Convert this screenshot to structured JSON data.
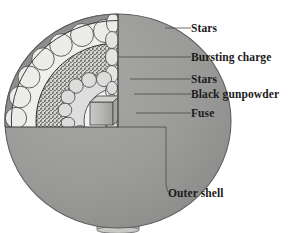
{
  "figure": {
    "background_color": "#ffffff",
    "text_color": "#1b1b1b",
    "leader_color": "#4a4a4a"
  },
  "labels": [
    {
      "key": "stars_outer",
      "text": "Stars",
      "x": 191,
      "y": 32,
      "leader": "M165,28 L191,28",
      "target": "outer-stars-layer"
    },
    {
      "key": "bursting_charge",
      "text": "Bursting charge",
      "x": 191,
      "y": 61,
      "leader": "M117,57 L191,57",
      "target": "bursting-charge-layer"
    },
    {
      "key": "stars_inner",
      "text": "Stars",
      "x": 191,
      "y": 83,
      "leader": "M130,79 L191,79",
      "target": "inner-stars-layer"
    },
    {
      "key": "black_gunpowder",
      "text": "Black gunpowder",
      "x": 191,
      "y": 98,
      "leader": "M134,94 L191,94",
      "target": "black-gunpowder-core"
    },
    {
      "key": "fuse",
      "text": "Fuse",
      "x": 191,
      "y": 117,
      "leader": "M136,113 L191,113",
      "target": "fuse-cylinder"
    },
    {
      "key": "outer_shell",
      "text": "Outer shell",
      "x": 168,
      "y": 197,
      "leader": "M118,127 L166,127 L166,185 L168,192",
      "target": "outer-shell-sphere"
    }
  ],
  "parts": {
    "outer_shell": {
      "name": "Outer shell",
      "color": "#9a9a9a",
      "edge_color": "#6f6f6f",
      "rim_color": "#8a8a8a"
    },
    "outer_stars": {
      "name": "Stars",
      "color": "#e6e6e4",
      "edge_color": "#4f4f4f",
      "count": 17
    },
    "bursting_charge": {
      "name": "Bursting charge",
      "color": "#b4b4b2",
      "texture": "stipple",
      "edge_color": "#3c3c3c"
    },
    "inner_stars": {
      "name": "Stars",
      "color": "#d8d8d6",
      "edge_color": "#4f4f4f",
      "count": 15
    },
    "black_gunpowder": {
      "name": "Black gunpowder",
      "color": "#f2f2f0",
      "edge_color": "#5a5a5a"
    },
    "fuse": {
      "name": "Fuse",
      "color": "#b9b9b7",
      "edge_color": "#4a4a4a"
    },
    "stem": {
      "name": "Stem",
      "color": "#c2c2c0",
      "edge_color": "#6a6a6a"
    }
  },
  "geometry": {
    "sphere_center_x": 118,
    "sphere_center_y": 121,
    "sphere_radius_x": 113,
    "sphere_radius_y": 107,
    "cut_corner_x": 118,
    "cut_corner_y": 127
  }
}
